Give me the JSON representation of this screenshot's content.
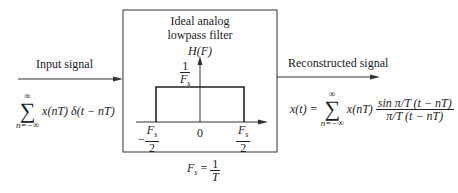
{
  "filter": {
    "title_line1": "Ideal analog",
    "title_line2": "lowpass filter",
    "axis_label": "H(F)",
    "gain_num": "1",
    "gain_den": "F",
    "gain_den_sub": "s",
    "tick_left_num": "−F",
    "tick_left_sub": "s",
    "tick_left_den": "2",
    "tick_center": "0",
    "tick_right_num": "F",
    "tick_right_sub": "s",
    "tick_right_den": "2"
  },
  "input": {
    "label": "Input signal",
    "sum_top": "∞",
    "sum_sym": "∑",
    "sum_bottom": "n=−∞",
    "expr": "x(nT) δ(t − nT)"
  },
  "output": {
    "label": "Reconstructed signal",
    "lhs": "x(t) =",
    "sum_top": "∞",
    "sum_sym": "∑",
    "sum_bottom": "n=−∞",
    "term": "x(nT)",
    "num": "sin π/T (t − nT)",
    "den": "π/T (t − nT)"
  },
  "sampling": {
    "lhs": "F",
    "lhs_sub": "s",
    "eq": "=",
    "num": "1",
    "den": "T"
  },
  "colors": {
    "stroke": "#222222",
    "background": "#ffffff"
  }
}
